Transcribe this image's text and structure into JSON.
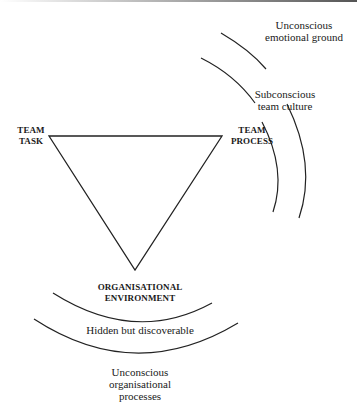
{
  "diagram": {
    "nodes": {
      "team_task": [
        "TEAM",
        "TASK"
      ],
      "team_process": [
        "TEAM",
        "PROCESS"
      ],
      "org_environment": [
        "ORGANISATIONAL",
        "ENVIRONMENT"
      ]
    },
    "layers": {
      "subconscious_team_culture": [
        "Subconscious",
        "team culture"
      ],
      "unconscious_emotional_ground": [
        "Unconscious",
        "emotional ground"
      ],
      "hidden_but_discoverable": "Hidden but discoverable",
      "unconscious_org_processes": [
        "Unconscious",
        "organisational",
        "processes"
      ]
    },
    "colors": {
      "line": "#222222",
      "background": "#ffffff"
    }
  }
}
